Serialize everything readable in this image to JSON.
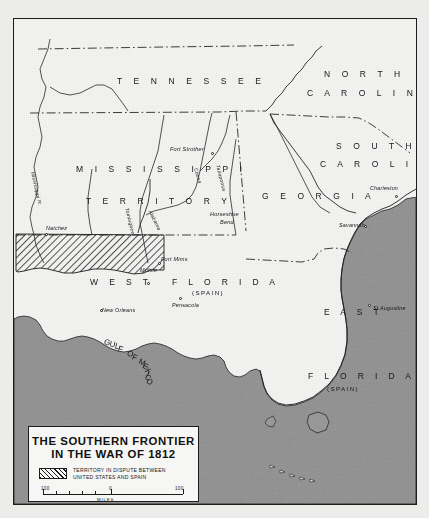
{
  "map": {
    "frame": {
      "title_present": true
    },
    "states": [
      {
        "name": "tennessee",
        "label": "T E N N E S S E E",
        "x": 103,
        "y": 57,
        "cls": "state"
      },
      {
        "name": "north-carolina-1",
        "label": "N O R T H",
        "x": 310,
        "y": 50,
        "cls": "state"
      },
      {
        "name": "north-carolina-2",
        "label": "C A R O L I N A",
        "x": 293,
        "y": 69,
        "cls": "state"
      },
      {
        "name": "south-carolina-1",
        "label": "S O U T H",
        "x": 322,
        "y": 122,
        "cls": "state"
      },
      {
        "name": "south-carolina-2",
        "label": "C A R O L I N A",
        "x": 306,
        "y": 140,
        "cls": "state"
      },
      {
        "name": "georgia",
        "label": "G E O R G I A",
        "x": 248,
        "y": 172,
        "cls": "state"
      },
      {
        "name": "mississippi",
        "label": "M I S S I S S I P P I",
        "x": 62,
        "y": 145,
        "cls": "state"
      },
      {
        "name": "territory",
        "label": "T E R R I T O R Y",
        "x": 72,
        "y": 177,
        "cls": "state"
      },
      {
        "name": "west-florida",
        "label": "W E S T",
        "x": 76,
        "y": 258,
        "cls": "region"
      },
      {
        "name": "florida-west",
        "label": "F L O R I D A",
        "x": 158,
        "y": 258,
        "cls": "region"
      },
      {
        "name": "east-florida-1",
        "label": "E A S T",
        "x": 310,
        "y": 288,
        "cls": "region"
      },
      {
        "name": "east-florida-2",
        "label": "F L O R I D A",
        "x": 294,
        "y": 352,
        "cls": "region"
      }
    ],
    "annotations": [
      {
        "name": "west-florida-spain",
        "label": "(SPAIN)",
        "x": 178,
        "y": 270
      },
      {
        "name": "east-florida-spain",
        "label": "(SPAIN)",
        "x": 313,
        "y": 366
      }
    ],
    "cities": [
      {
        "name": "natchez",
        "label": "Natchez",
        "lx": 32,
        "ly": 206,
        "dx": 31,
        "dy": 214
      },
      {
        "name": "new-orleans",
        "label": "New Orleans",
        "lx": 88,
        "ly": 288,
        "dx": 86,
        "dy": 290
      },
      {
        "name": "mobile",
        "label": "Mobile",
        "lx": 126,
        "ly": 248,
        "dx": 133,
        "dy": 263
      },
      {
        "name": "pensacola",
        "label": "Pensacola",
        "lx": 158,
        "ly": 283,
        "dx": 165,
        "dy": 278
      },
      {
        "name": "charleston",
        "label": "Charleston",
        "lx": 356,
        "ly": 166,
        "dx": 381,
        "dy": 176
      },
      {
        "name": "savannah",
        "label": "Savannah",
        "lx": 325,
        "ly": 203,
        "dx": 350,
        "dy": 206
      },
      {
        "name": "st-augustine",
        "label": "St Augustine",
        "lx": 359,
        "ly": 286,
        "dx": 354,
        "dy": 285
      }
    ],
    "battle_sites": [
      {
        "name": "fort-strother",
        "label": "Fort Strother",
        "lx": 156,
        "ly": 127,
        "dx": 197,
        "dy": 133
      },
      {
        "name": "horseshoe-bend-1",
        "label": "Horseshoe Bend",
        "lx": 196,
        "ly": 192,
        "dx": 0,
        "dy": 0
      },
      {
        "name": "fort-mims",
        "label": "Fort Mims",
        "lx": 147,
        "ly": 237,
        "dx": 144,
        "dy": 243
      }
    ],
    "horseshoe_lines": [
      "Horseshoe",
      "Bend"
    ],
    "rivers": [
      {
        "name": "mississippi-river",
        "label": "Mississippi R.",
        "x": 22,
        "y": 152,
        "rot": 78
      },
      {
        "name": "tombigbee-river",
        "label": "Tombigbee",
        "x": 116,
        "y": 188,
        "rot": 76
      },
      {
        "name": "alabama-river",
        "label": "Alabama",
        "x": 139,
        "y": 190,
        "rot": 64
      },
      {
        "name": "coosa-river",
        "label": "Coosa",
        "x": 185,
        "y": 148,
        "rot": 74
      },
      {
        "name": "tallapoosa-river",
        "label": "Tallapoosa",
        "x": 207,
        "y": 145,
        "rot": 76
      }
    ],
    "water_labels": {
      "gulf_of_mexico": "GULF OF MEXICO"
    }
  },
  "cartouche": {
    "title_line1": "THE SOUTHERN FRONTIER",
    "title_line2": "IN THE WAR OF 1812",
    "legend_line1": "TERRITORY IN DISPUTE BETWEEN",
    "legend_line2": "UNITED STATES AND SPAIN",
    "scale": {
      "left": "100",
      "middle": "0",
      "right": "100",
      "units": "MILES"
    }
  },
  "colors": {
    "paper": "#f4f4f2",
    "water": "#9a9a9a",
    "ink": "#1c1c1c",
    "hatch": "#1c1c1c"
  }
}
